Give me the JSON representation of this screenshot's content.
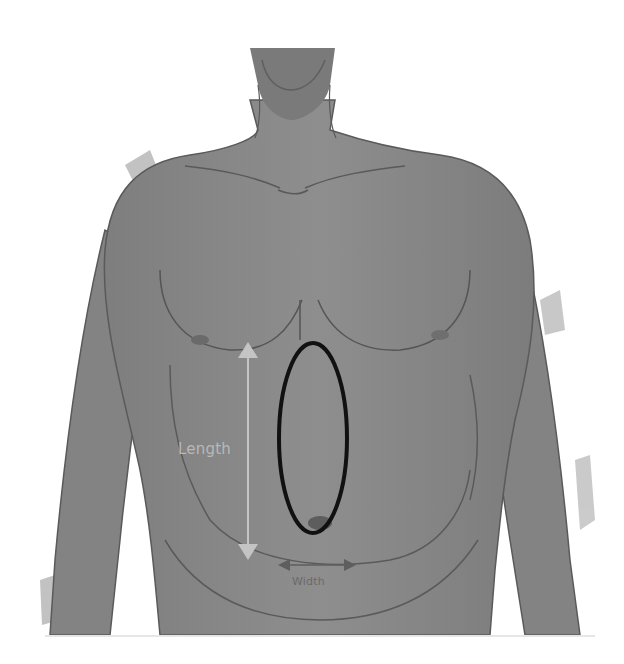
{
  "figure": {
    "style": "grayscale watercolor illustration",
    "colors": {
      "background": "#ffffff",
      "skin": "#8a8a8a",
      "skin_dark": "#6f6f6f",
      "outline": "#555555",
      "ellipse": "#111111",
      "length_arrow": "#c4c4c4",
      "width_arrow": "#5e5e5e"
    }
  },
  "annotations": {
    "length_label": "Length",
    "width_label": "Width",
    "marked_region": "vertical ellipse over midline abdomen, from below sternum to umbilicus"
  }
}
